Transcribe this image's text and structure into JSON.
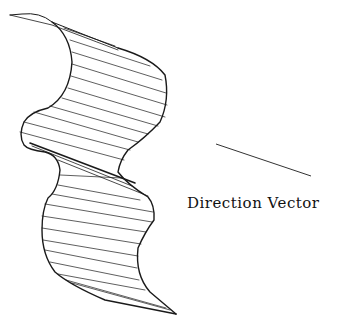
{
  "diagram": {
    "type": "swept surface line drawing",
    "line_color": "#1a1a1a",
    "background": "#ffffff",
    "direction_vector": {
      "label": "Direction Vector",
      "start": [
        216,
        144
      ],
      "end": [
        311,
        176
      ]
    }
  }
}
